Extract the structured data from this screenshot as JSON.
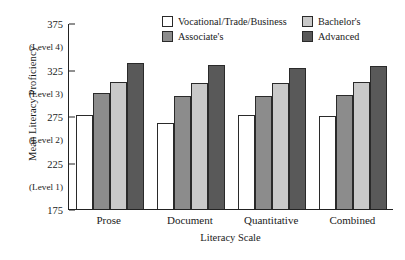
{
  "chart_data": {
    "type": "bar",
    "title": "",
    "xlabel": "Literacy Scale",
    "ylabel": "Mean Literacy Proficiency",
    "categories": [
      "Prose",
      "Document",
      "Quantitative",
      "Combined"
    ],
    "series": [
      {
        "name": "Vocational/Trade/Business",
        "color": "#ffffff",
        "values": [
          276,
          267,
          276,
          275
        ]
      },
      {
        "name": "Associate's",
        "color": "#8c8c8c",
        "values": [
          300,
          296,
          297,
          298
        ]
      },
      {
        "name": "Bachelor's",
        "color": "#c9c9c9",
        "values": [
          312,
          310,
          310,
          312
        ]
      },
      {
        "name": "Advanced",
        "color": "#595959",
        "values": [
          332,
          330,
          327,
          329
        ]
      }
    ],
    "ylim": [
      175,
      375
    ],
    "y_numeric_ticks": [
      175,
      225,
      275,
      325,
      375
    ],
    "y_level_ticks": [
      {
        "label": "(Level 1)",
        "value": 200
      },
      {
        "label": "(Level 2)",
        "value": 250
      },
      {
        "label": "(Level 3)",
        "value": 300
      },
      {
        "label": "(Level 4)",
        "value": 350
      }
    ],
    "grid": false,
    "legend_position": "top-center"
  },
  "axes": {
    "y_title": "Mean Literacy Proficiency",
    "x_title": "Literacy Scale"
  },
  "legend": {
    "entries": [
      {
        "label": "Vocational/Trade/Business",
        "swatch": "s0"
      },
      {
        "label": "Bachelor's",
        "swatch": "s2"
      },
      {
        "label": "Associate's",
        "swatch": "s1"
      },
      {
        "label": "Advanced",
        "swatch": "s3"
      }
    ]
  }
}
